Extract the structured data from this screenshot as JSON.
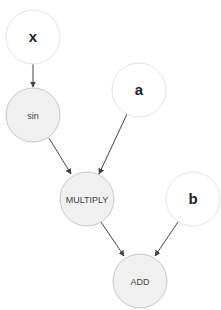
{
  "diagram": {
    "type": "computation-graph",
    "nodes": [
      {
        "id": "x",
        "label": "x",
        "kind": "input"
      },
      {
        "id": "sin",
        "label": "sin",
        "kind": "operation"
      },
      {
        "id": "a",
        "label": "a",
        "kind": "input"
      },
      {
        "id": "multiply",
        "label": "MULTIPLY",
        "kind": "operation"
      },
      {
        "id": "b",
        "label": "b",
        "kind": "input"
      },
      {
        "id": "add",
        "label": "ADD",
        "kind": "operation"
      }
    ],
    "edges": [
      {
        "from": "x",
        "to": "sin"
      },
      {
        "from": "sin",
        "to": "multiply"
      },
      {
        "from": "a",
        "to": "multiply"
      },
      {
        "from": "multiply",
        "to": "add"
      },
      {
        "from": "b",
        "to": "add"
      }
    ],
    "colors": {
      "input_fill": "#ffffff",
      "input_stroke": "#e4e4e4",
      "op_fill": "#f0f0f0",
      "op_stroke": "#c8c8c8",
      "edge": "#444444"
    }
  }
}
